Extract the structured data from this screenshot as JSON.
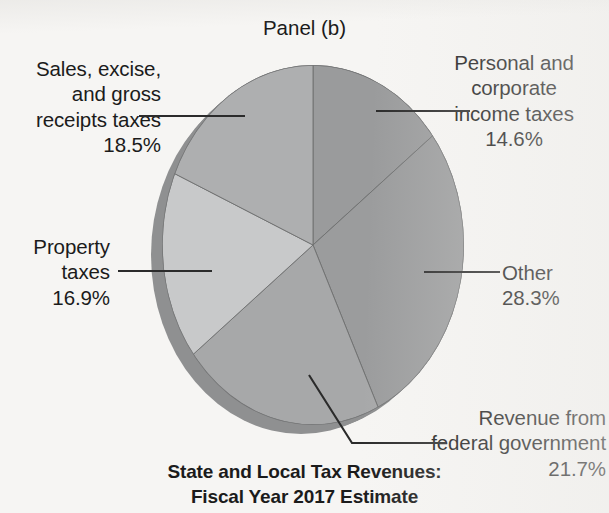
{
  "panel": {
    "title": "Panel (b)"
  },
  "caption": {
    "line1": "State and Local Tax Revenues:",
    "line2": "Fiscal Year 2017 Estimate",
    "text": "State and Local Tax Revenues:\nFiscal Year 2017 Estimate"
  },
  "labels": {
    "sales": {
      "name": "Sales, excise,\nand gross\nreceipts taxes",
      "value": "18.5%"
    },
    "personal": {
      "name": "Personal and\ncorporate\nincome taxes",
      "value": "14.6%"
    },
    "property": {
      "name": "Property\ntaxes",
      "value": "16.9%"
    },
    "other": {
      "name": "Other",
      "value": "28.3%"
    },
    "federal": {
      "name": "Revenue from\nfederal government",
      "value": "21.7%"
    }
  },
  "colors": {
    "background": "#f6f5f3",
    "text": "#1b1b1b",
    "leader_line": "#2b2b2b",
    "rim_shadow": "#8a8b8c",
    "slice_personal": "#9a9b9c",
    "slice_other": "#9b9c9d",
    "slice_federal": "#a7a8a9",
    "slice_property": "#c8c9ca",
    "slice_sales": "#aeafb0",
    "slice_edge": "#6f7071"
  },
  "chart_data": {
    "type": "pie",
    "title": "State and Local Tax Revenues: Fiscal Year 2017 Estimate",
    "subtitle": "Panel (b)",
    "unit": "percent",
    "legend": "callout-labels",
    "start_angle_deg": 0,
    "direction": "clockwise",
    "labels": [
      "Personal and corporate income taxes",
      "Other",
      "Revenue from federal government",
      "Property taxes",
      "Sales, excise, and gross receipts taxes"
    ],
    "values": [
      14.6,
      28.3,
      21.7,
      16.9,
      18.5
    ],
    "slices": [
      {
        "label": "Personal and corporate income taxes",
        "value": 14.6,
        "display": "14.6%",
        "color": "#9a9b9c",
        "start_deg": 0.0,
        "end_deg": 52.56
      },
      {
        "label": "Other",
        "value": 28.3,
        "display": "28.3%",
        "color": "#9b9c9d",
        "start_deg": 52.56,
        "end_deg": 154.44
      },
      {
        "label": "Revenue from federal government",
        "value": 21.7,
        "display": "21.7%",
        "color": "#a7a8a9",
        "start_deg": 154.44,
        "end_deg": 232.56
      },
      {
        "label": "Property taxes",
        "value": 16.9,
        "display": "16.9%",
        "color": "#c8c9ca",
        "start_deg": 232.56,
        "end_deg": 293.4
      },
      {
        "label": "Sales, excise, and gross receipts taxes",
        "value": 18.5,
        "display": "18.5%",
        "color": "#aeafb0",
        "start_deg": 293.4,
        "end_deg": 360.0
      }
    ]
  }
}
